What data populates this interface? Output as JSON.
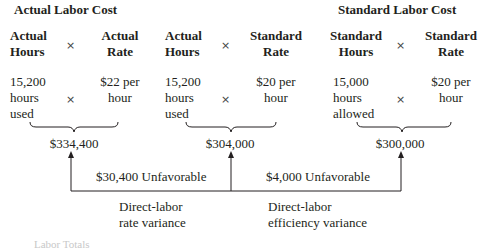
{
  "headings": {
    "actual": "Actual Labor Cost",
    "standard": "Standard Labor Cost"
  },
  "columns": [
    {
      "header_line1": "Actual",
      "header_line2": "Hours",
      "value_lines": [
        "15,200",
        "hours",
        "used"
      ]
    },
    {
      "header_line1": "Actual",
      "header_line2": "Rate",
      "value_lines": [
        "$22 per",
        "hour"
      ]
    },
    {
      "header_line1": "Actual",
      "header_line2": "Hours",
      "value_lines": [
        "15,200",
        "hours",
        "used"
      ]
    },
    {
      "header_line1": "Standard",
      "header_line2": "Rate",
      "value_lines": [
        "$20 per",
        "hour"
      ]
    },
    {
      "header_line1": "Standard",
      "header_line2": "Hours",
      "value_lines": [
        "15,000",
        "hours",
        "allowed"
      ]
    },
    {
      "header_line1": "Standard",
      "header_line2": "Rate",
      "value_lines": [
        "$20 per",
        "hour"
      ]
    }
  ],
  "multiply_symbol": "×",
  "totals": [
    "$334,400",
    "$304,000",
    "$300,000"
  ],
  "variances": [
    {
      "amount": "$30,400 Unfavorable",
      "label_line1": "Direct-labor",
      "label_line2": "rate variance"
    },
    {
      "amount": "$4,000 Unfavorable",
      "label_line1": "Direct-labor",
      "label_line2": "efficiency variance"
    }
  ],
  "footer_partial": "Labor Totals"
}
